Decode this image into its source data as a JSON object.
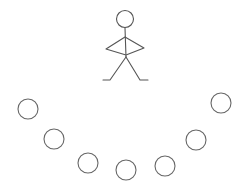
{
  "diagram": {
    "stroke_color": "#555555",
    "figure": {
      "head": {
        "cx": 125,
        "cy": 19,
        "r": 8.5
      },
      "label": "stick-figure"
    },
    "circles": [
      {
        "cx": 28,
        "cy": 109,
        "r": 10
      },
      {
        "cx": 54,
        "cy": 139,
        "r": 10
      },
      {
        "cx": 88,
        "cy": 163,
        "r": 10
      },
      {
        "cx": 126,
        "cy": 170,
        "r": 10
      },
      {
        "cx": 165,
        "cy": 166,
        "r": 10
      },
      {
        "cx": 196,
        "cy": 140,
        "r": 10
      },
      {
        "cx": 221,
        "cy": 103,
        "r": 10
      }
    ]
  }
}
